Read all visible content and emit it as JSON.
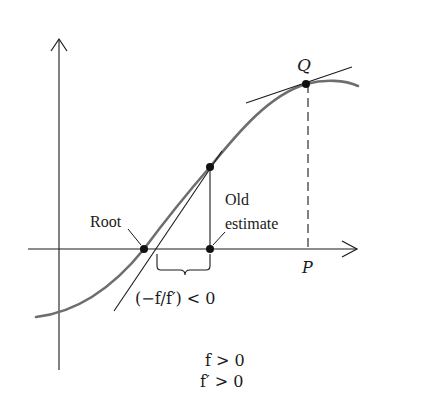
{
  "figure": {
    "labels": {
      "q": "Q",
      "p": "P",
      "root": "Root",
      "old_estimate_line1": "Old",
      "old_estimate_line2": "estimate",
      "step": "(−f/f′) < 0",
      "cond1": "f > 0",
      "cond2": "f′ > 0"
    },
    "colors": {
      "curve": "#6e6e6e",
      "lines": "#1a1a1a",
      "background": "#ffffff"
    },
    "points": {
      "root": {
        "x": 144,
        "y": 249
      },
      "old_estimate": {
        "x": 210,
        "y": 249
      },
      "curve_point": {
        "x": 210,
        "y": 167
      },
      "q": {
        "x": 306,
        "y": 84
      }
    },
    "axes": {
      "x_axis": {
        "x1": 28,
        "x2": 358,
        "y": 249
      },
      "y_axis": {
        "x": 59,
        "y1": 40,
        "y2": 370
      }
    }
  }
}
